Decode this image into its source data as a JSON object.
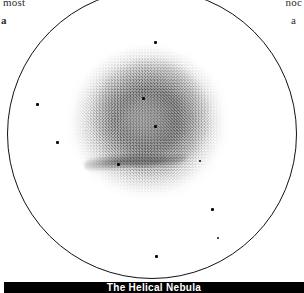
{
  "page": {
    "background_color": "#ffffff",
    "ink_color": "#111111"
  },
  "bleed_text": {
    "top_left": "most",
    "top_right": "noc",
    "left_label": "a",
    "right_label": "a"
  },
  "field_of_view": {
    "name": "eyepiece-field-circle",
    "shape": "circle",
    "stroke_color": "#111111"
  },
  "object": {
    "name": "The Helical Nebula",
    "rendering": "inverted-negative-photographic-plate",
    "structure": "diffuse round annular planetary nebula with mottled grain and a dark filament arc on the lower edge"
  },
  "stars": [
    {
      "id": "star-top-center",
      "x": 155,
      "y": 42,
      "size": 3
    },
    {
      "id": "star-nebula-upper",
      "x": 143,
      "y": 98,
      "size": 3
    },
    {
      "id": "star-nebula-core",
      "x": 155,
      "y": 126,
      "size": 3
    },
    {
      "id": "star-left-upper",
      "x": 37,
      "y": 104,
      "size": 3
    },
    {
      "id": "star-left-lower",
      "x": 57,
      "y": 142,
      "size": 3
    },
    {
      "id": "star-filament",
      "x": 118,
      "y": 164,
      "size": 3
    },
    {
      "id": "star-nebula-faint",
      "x": 200,
      "y": 161,
      "size": 2
    },
    {
      "id": "star-right-lower",
      "x": 212,
      "y": 209,
      "size": 3
    },
    {
      "id": "star-right-edge",
      "x": 218,
      "y": 238,
      "size": 2
    },
    {
      "id": "star-bottom",
      "x": 156,
      "y": 256,
      "size": 3
    }
  ],
  "caption": {
    "text": "The Helical Nebula",
    "background_color": "#000000",
    "text_color": "#ffffff"
  }
}
